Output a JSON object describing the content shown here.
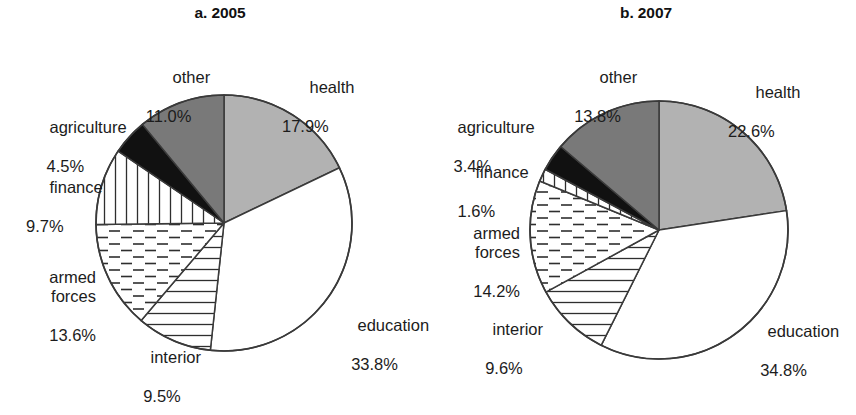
{
  "figure": {
    "background": "#ffffff",
    "stroke": "#3a3a3a"
  },
  "panels": [
    {
      "id": "a",
      "title": "a. 2005",
      "cx": 224,
      "cy": 223,
      "r": 128,
      "slices": [
        {
          "label": "health",
          "pct": "17.9%",
          "value": 17.9,
          "fill": "#b2b2b2",
          "pattern": "solid-gray"
        },
        {
          "label": "education",
          "pct": "33.8%",
          "value": 33.8,
          "fill": "#ffffff",
          "pattern": "blank"
        },
        {
          "label": "interior",
          "pct": "9.5%",
          "value": 9.5,
          "fill": "#ffffff",
          "pattern": "horizontal"
        },
        {
          "label": "armed forces",
          "pct": "13.6%",
          "value": 13.6,
          "fill": "#ffffff",
          "pattern": "dashed"
        },
        {
          "label": "finance",
          "pct": "9.7%",
          "value": 9.7,
          "fill": "#ffffff",
          "pattern": "vertical"
        },
        {
          "label": "agriculture",
          "pct": "4.5%",
          "value": 4.5,
          "fill": "#111111",
          "pattern": "solid-black"
        },
        {
          "label": "other",
          "pct": "11.0%",
          "value": 11.0,
          "fill": "#797979",
          "pattern": "solid-dkgray"
        }
      ]
    },
    {
      "id": "b",
      "title": "b. 2007",
      "cx": 231,
      "cy": 230,
      "r": 129,
      "slices": [
        {
          "label": "health",
          "pct": "22.6%",
          "value": 22.6,
          "fill": "#b2b2b2",
          "pattern": "solid-gray"
        },
        {
          "label": "education",
          "pct": "34.8%",
          "value": 34.8,
          "fill": "#ffffff",
          "pattern": "blank"
        },
        {
          "label": "interior",
          "pct": "9.6%",
          "value": 9.6,
          "fill": "#ffffff",
          "pattern": "horizontal"
        },
        {
          "label": "armed forces",
          "pct": "14.2%",
          "value": 14.2,
          "fill": "#ffffff",
          "pattern": "dashed"
        },
        {
          "label": "finance",
          "pct": "1.6%",
          "value": 1.6,
          "fill": "#ffffff",
          "pattern": "vertical"
        },
        {
          "label": "agriculture",
          "pct": "3.4%",
          "value": 3.4,
          "fill": "#111111",
          "pattern": "solid-black"
        },
        {
          "label": "other",
          "pct": "13.8%",
          "value": 13.8,
          "fill": "#797979",
          "pattern": "solid-dkgray"
        }
      ]
    }
  ],
  "labels": {
    "a": {
      "other": {
        "name": "other",
        "pct": "11.0%"
      },
      "agriculture": {
        "name": "agriculture",
        "pct": "4.5%"
      },
      "finance": {
        "name": "finance",
        "pct": "9.7%"
      },
      "armed": {
        "name": "armed\nforces",
        "pct": "13.6%"
      },
      "interior": {
        "name": "interior",
        "pct": "9.5%"
      },
      "health": {
        "name": "health",
        "pct": "17.9%"
      },
      "education": {
        "name": "education",
        "pct": "33.8%"
      }
    },
    "b": {
      "other": {
        "name": "other",
        "pct": "13.8%"
      },
      "agriculture": {
        "name": "agriculture",
        "pct": "3.4%"
      },
      "finance": {
        "name": "finance",
        "pct": "1.6%"
      },
      "armed": {
        "name": "armed\nforces",
        "pct": "14.2%"
      },
      "interior": {
        "name": "interior",
        "pct": "9.6%"
      },
      "health": {
        "name": "health",
        "pct": "22.6%"
      },
      "education": {
        "name": "education",
        "pct": "34.8%"
      }
    }
  },
  "chart_data": [
    {
      "type": "pie",
      "title": "a. 2005",
      "categories": [
        "health",
        "education",
        "interior",
        "armed forces",
        "finance",
        "agriculture",
        "other"
      ],
      "values": [
        17.9,
        33.8,
        9.5,
        13.6,
        9.7,
        4.5,
        11.0
      ],
      "units": "percent",
      "start_angle_deg": 0,
      "direction": "clockwise",
      "legend": "none",
      "grid": false,
      "xlabel": "",
      "ylabel": ""
    },
    {
      "type": "pie",
      "title": "b. 2007",
      "categories": [
        "health",
        "education",
        "interior",
        "armed forces",
        "finance",
        "agriculture",
        "other"
      ],
      "values": [
        22.6,
        34.8,
        9.6,
        14.2,
        1.6,
        3.4,
        13.8
      ],
      "units": "percent",
      "start_angle_deg": 0,
      "direction": "clockwise",
      "legend": "none",
      "grid": false,
      "xlabel": "",
      "ylabel": ""
    }
  ]
}
